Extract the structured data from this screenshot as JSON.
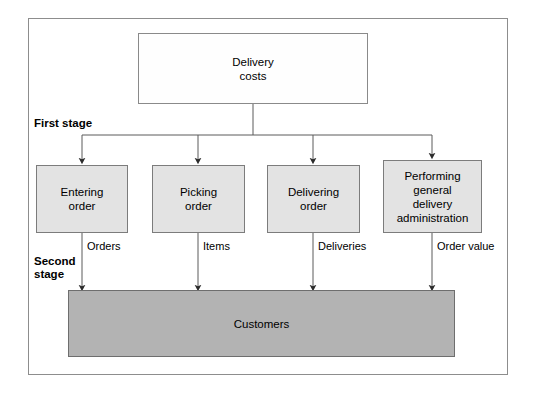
{
  "diagram": {
    "type": "two-stage activity-based costing flow chart",
    "root": {
      "label": "Delivery\ncosts",
      "fill": "#fefefe",
      "border": "#8a8a8a"
    },
    "stage_labels": {
      "first": "First stage",
      "second": "Second\nstage"
    },
    "first_stage": {
      "fill": "#e3e3e3",
      "border": "#7c7c7c",
      "nodes": [
        {
          "label": "Entering\norder"
        },
        {
          "label": "Picking\norder"
        },
        {
          "label": "Delivering\norder"
        },
        {
          "label": "Performing\ngeneral\ndelivery\nadministration"
        }
      ]
    },
    "second_stage": {
      "fill": "#b3b3b3",
      "border": "#6e6e6e",
      "node": {
        "label": "Customers"
      }
    },
    "cost_driver_labels": [
      "Orders",
      "Items",
      "Deliveries",
      "Order value"
    ]
  }
}
